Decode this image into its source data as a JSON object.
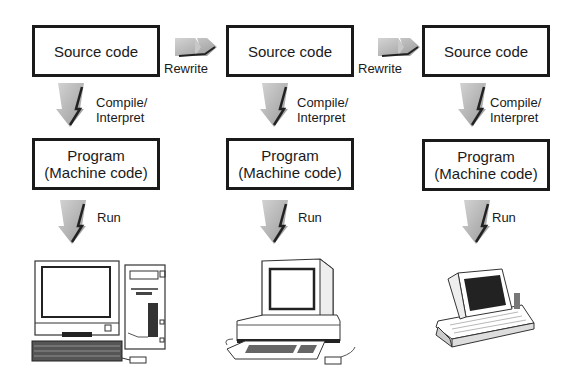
{
  "columns": [
    {
      "source_label": "Source code",
      "compile_label_line1": "Compile/",
      "compile_label_line2": "Interpret",
      "program_label_line1": "Program",
      "program_label_line2": "(Machine code)",
      "run_label": "Run",
      "device": "desktop-tower-computer"
    },
    {
      "source_label": "Source code",
      "compile_label_line1": "Compile/",
      "compile_label_line2": "Interpret",
      "program_label_line1": "Program",
      "program_label_line2": "(Machine code)",
      "run_label": "Run",
      "device": "desktop-workstation-computer"
    },
    {
      "source_label": "Source code",
      "compile_label_line1": "Compile/",
      "compile_label_line2": "Interpret",
      "program_label_line1": "Program",
      "program_label_line2": "(Machine code)",
      "run_label": "Run",
      "device": "laptop-computer"
    }
  ],
  "rewrite_arrows": [
    {
      "label": "Rewrite"
    },
    {
      "label": "Rewrite"
    }
  ],
  "colors": {
    "arrow_fill": "#b0b0b0",
    "arrow_shadow": "#222222",
    "border": "#1a1a1a"
  }
}
